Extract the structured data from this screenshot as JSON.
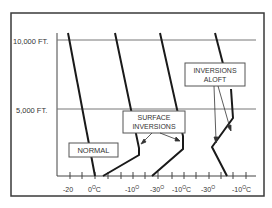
{
  "diagram": {
    "type": "temperature-altitude-profiles",
    "y_axis": {
      "labels": [
        {
          "text": "10,000 FT.",
          "altitude_ft": 10000
        },
        {
          "text": "5,000 FT.",
          "altitude_ft": 5000
        }
      ]
    },
    "x_axis": {
      "tick_labels": [
        {
          "text": "-20",
          "sup": ""
        },
        {
          "text": "0",
          "sup": "O",
          "suffix": "C"
        },
        {
          "text": "-10",
          "sup": "O",
          "suffix": ""
        },
        {
          "text": "-30",
          "sup": "O",
          "suffix": ""
        },
        {
          "text": "-10",
          "sup": "O",
          "suffix": "C"
        },
        {
          "text": "-30",
          "sup": "O",
          "suffix": ""
        },
        {
          "text": "-10",
          "sup": "O",
          "suffix": "C"
        }
      ]
    },
    "callouts": {
      "normal": "NORMAL",
      "surface_inversions_line1": "SURFACE",
      "surface_inversions_line2": "INVERSIONS",
      "inversions_aloft_line1": "INVERSIONS",
      "inversions_aloft_line2": "ALOFT"
    },
    "profiles": [
      {
        "name": "normal",
        "description": "temperature decreases steadily with altitude"
      },
      {
        "name": "surface-inversion-1",
        "description": "temperature increases near the surface, then decreases"
      },
      {
        "name": "surface-inversion-2",
        "description": "temperature increases near the surface, then decreases"
      },
      {
        "name": "inversion-aloft",
        "description": "temperature increases in a layer aloft"
      }
    ],
    "colors": {
      "line": "#1a1a1a",
      "frame": "#3a3a3a",
      "grid": "#777777"
    }
  }
}
